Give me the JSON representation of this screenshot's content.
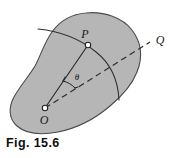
{
  "figure": {
    "caption": "Fig. 15.6",
    "background_color": "#ffffff",
    "body_fill_color": "#b6b6b6",
    "body_stroke_color": "#4a4a4a",
    "line_color": "#2b2b2b",
    "label_color": "#1a1a1a",
    "labels": {
      "point_p": "P",
      "point_o": "O",
      "point_q": "Q",
      "angle_theta": "θ"
    },
    "elements": {
      "body_shape_name": "rigid-body-outline",
      "radius_line_name": "line-op",
      "reference_line_name": "dashed-line-oq",
      "angle_arc_name": "angle-arc-theta",
      "body_arc_name": "reference-curve-through-p",
      "marker_p_name": "point-marker-p",
      "marker_o_name": "point-marker-o"
    }
  }
}
